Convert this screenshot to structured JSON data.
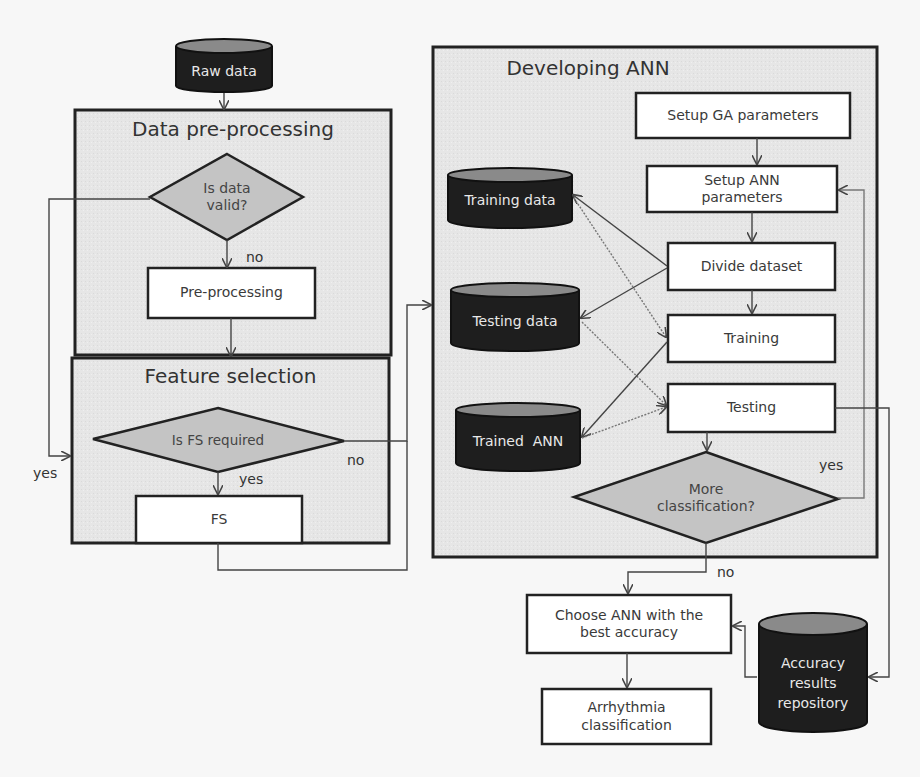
{
  "diagram": {
    "type": "flowchart",
    "colors": {
      "panel_fill": "#e6e6e6",
      "panel_border": "#222222",
      "process_fill": "#ffffff",
      "decision_fill": "#c4c4c4",
      "datastore_fill": "#1e1e1e",
      "datastore_top": "#8a8a8a",
      "datastore_text": "#e8e8e8"
    },
    "panels": {
      "preprocessing": {
        "title": "Data pre-processing"
      },
      "feature_selection": {
        "title": "Feature selection"
      },
      "developing_ann": {
        "title": "Developing ANN"
      }
    },
    "nodes": {
      "raw_data": {
        "label": "Raw data",
        "shape": "datastore"
      },
      "is_data_valid": {
        "line1": "Is data",
        "line2": "valid?",
        "shape": "decision"
      },
      "pre_processing": {
        "label": "Pre-processing",
        "shape": "process"
      },
      "is_fs_required": {
        "label": "Is FS required",
        "shape": "decision"
      },
      "fs": {
        "label": "FS",
        "shape": "process"
      },
      "setup_ga": {
        "label": "Setup GA parameters",
        "shape": "process"
      },
      "setup_ann": {
        "line1": "Setup ANN",
        "line2": "parameters",
        "shape": "process"
      },
      "divide_dataset": {
        "label": "Divide dataset",
        "shape": "process"
      },
      "training": {
        "label": "Training",
        "shape": "process"
      },
      "testing": {
        "label": "Testing",
        "shape": "process"
      },
      "more_classification": {
        "line1": "More",
        "line2": "classification?",
        "shape": "decision"
      },
      "training_data": {
        "label": "Training data",
        "shape": "datastore"
      },
      "testing_data": {
        "label": "Testing data",
        "shape": "datastore"
      },
      "trained_ann": {
        "label": "Trained  ANN",
        "shape": "datastore"
      },
      "choose_ann": {
        "line1": "Choose ANN with the",
        "line2": "best accuracy",
        "shape": "process"
      },
      "arrhythmia": {
        "line1": "Arrhythmia",
        "line2": "classification",
        "shape": "process"
      },
      "accuracy_repo": {
        "line1": "Accuracy",
        "line2": "results",
        "line3": "repository",
        "shape": "datastore"
      }
    },
    "edge_labels": {
      "valid_no": "no",
      "valid_yes": "yes",
      "fs_yes": "yes",
      "fs_no": "no",
      "more_yes": "yes",
      "more_no": "no"
    },
    "edges": [
      {
        "from": "raw_data",
        "to": "preprocessing"
      },
      {
        "from": "is_data_valid",
        "to": "pre_processing",
        "label": "no"
      },
      {
        "from": "is_data_valid",
        "to": "feature_selection",
        "label": "yes"
      },
      {
        "from": "preprocessing",
        "to": "feature_selection"
      },
      {
        "from": "is_fs_required",
        "to": "fs",
        "label": "yes"
      },
      {
        "from": "is_fs_required",
        "to": "developing_ann",
        "label": "no"
      },
      {
        "from": "fs",
        "to": "developing_ann"
      },
      {
        "from": "setup_ga",
        "to": "setup_ann"
      },
      {
        "from": "setup_ann",
        "to": "divide_dataset"
      },
      {
        "from": "divide_dataset",
        "to": "training"
      },
      {
        "from": "divide_dataset",
        "to": "training_data"
      },
      {
        "from": "divide_dataset",
        "to": "testing_data"
      },
      {
        "from": "training_data",
        "to": "training"
      },
      {
        "from": "testing_data",
        "to": "testing"
      },
      {
        "from": "training",
        "to": "trained_ann"
      },
      {
        "from": "trained_ann",
        "to": "testing"
      },
      {
        "from": "testing",
        "to": "more_classification"
      },
      {
        "from": "testing",
        "to": "accuracy_repo"
      },
      {
        "from": "more_classification",
        "to": "setup_ann",
        "label": "yes"
      },
      {
        "from": "more_classification",
        "to": "choose_ann",
        "label": "no"
      },
      {
        "from": "accuracy_repo",
        "to": "choose_ann"
      },
      {
        "from": "choose_ann",
        "to": "arrhythmia"
      }
    ]
  }
}
